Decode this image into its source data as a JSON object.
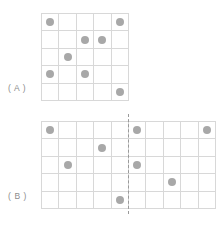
{
  "figure": {
    "title": "",
    "background_color": "#ffffff",
    "dot_color": "#a8a8a8",
    "grid_line_color": "#d8d8d8",
    "mirror_line_color": "#9a9a9a",
    "label_color": "#8c8c8c"
  },
  "panels": [
    {
      "id": "A",
      "label": "( A )",
      "grid": {
        "columns": 5,
        "rows": 5
      },
      "has_mirror_line": false,
      "dots": [
        {
          "row": 1,
          "col": 1
        },
        {
          "row": 1,
          "col": 5
        },
        {
          "row": 2,
          "col": 3
        },
        {
          "row": 2,
          "col": 4
        },
        {
          "row": 3,
          "col": 2
        },
        {
          "row": 4,
          "col": 1
        },
        {
          "row": 4,
          "col": 3
        },
        {
          "row": 5,
          "col": 5
        }
      ]
    },
    {
      "id": "B",
      "label": "( B )",
      "grid": {
        "columns": 10,
        "rows": 5
      },
      "has_mirror_line": true,
      "mirror_line_after_column": 5,
      "dots": [
        {
          "row": 1,
          "col": 1
        },
        {
          "row": 1,
          "col": 6
        },
        {
          "row": 1,
          "col": 10
        },
        {
          "row": 2,
          "col": 4
        },
        {
          "row": 3,
          "col": 2
        },
        {
          "row": 3,
          "col": 6
        },
        {
          "row": 4,
          "col": 8
        },
        {
          "row": 5,
          "col": 5
        }
      ]
    }
  ]
}
